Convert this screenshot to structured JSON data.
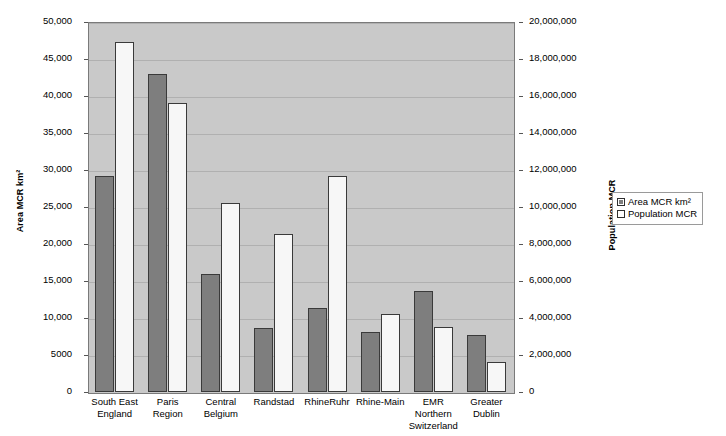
{
  "chart_data": {
    "type": "bar",
    "title": "",
    "xlabel": "",
    "ylabel": "Area MCR km²",
    "y2label": "Population MCR",
    "grid": true,
    "legend_position": "right",
    "categories": [
      "South East\nEngland",
      "Paris\nRegion",
      "Central\nBelgium",
      "Randstad",
      "RhineRuhr",
      "Rhine-Main",
      "EMR Northern\nSwitzerland",
      "Greater\nDublin"
    ],
    "series": [
      {
        "name": "Area MCR km²",
        "axis": "left",
        "color": "#7e7e7e",
        "values": [
          29200,
          43000,
          16000,
          8700,
          11400,
          8100,
          13600,
          7700
        ]
      },
      {
        "name": "Population MCR",
        "axis": "right",
        "color": "#f7f7f7",
        "values": [
          18900000,
          15600000,
          10200000,
          8550000,
          11700000,
          4200000,
          3500000,
          1600000
        ]
      }
    ],
    "ylim": [
      0,
      50000
    ],
    "y2lim": [
      0,
      20000000
    ],
    "ytick_labels": [
      "0",
      "5000",
      "10,000",
      "15,000",
      "20,000",
      "25,000",
      "30,000",
      "35,000",
      "40,000",
      "45,000",
      "50,000"
    ],
    "ytick_values": [
      0,
      5000,
      10000,
      15000,
      20000,
      25000,
      30000,
      35000,
      40000,
      45000,
      50000
    ],
    "y2tick_labels": [
      "0",
      "2,000,000",
      "4,000,000",
      "6,000,000",
      "8,000,000",
      "10,000,000",
      "12,000,000",
      "14,000,000",
      "16,000,000",
      "18,000,000",
      "20,000,000"
    ],
    "y2tick_values": [
      0,
      2000000,
      4000000,
      6000000,
      8000000,
      10000000,
      12000000,
      14000000,
      16000000,
      18000000,
      20000000
    ]
  },
  "legend": {
    "items": [
      {
        "label": "Area MCR km²",
        "swatch": "area"
      },
      {
        "label": "Population MCR",
        "swatch": "pop"
      }
    ]
  },
  "colors": {
    "plot_background": "#c9c9c9",
    "gridline": "#b0b0b0",
    "area_bar": "#7e7e7e",
    "population_bar": "#f7f7f7",
    "bar_border": "#3a3a3a",
    "page_background": "#ffffff"
  }
}
